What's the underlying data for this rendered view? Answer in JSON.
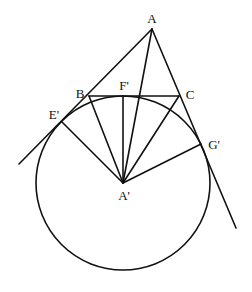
{
  "diagram": {
    "type": "geometry",
    "stroke_color": "#111111",
    "background": "#ffffff",
    "points": {
      "A": {
        "label": "A",
        "x": 152,
        "y": 29,
        "lx": 152,
        "ly": 23
      },
      "B": {
        "label": "B",
        "x": 89,
        "y": 96,
        "lx": 80,
        "ly": 98
      },
      "C": {
        "label": "C",
        "x": 179,
        "y": 96,
        "lx": 190,
        "ly": 99
      },
      "F1": {
        "label": "F'",
        "x": 123,
        "y": 96,
        "lx": 123,
        "ly": 90
      },
      "E1": {
        "label": "E'",
        "x": 62,
        "y": 122,
        "lx": 53,
        "ly": 119
      },
      "G1": {
        "label": "G'",
        "x": 201,
        "y": 144,
        "lx": 213,
        "ly": 149
      },
      "A1": {
        "label": "A'",
        "x": 123,
        "y": 183,
        "lx": 124,
        "ly": 200
      }
    },
    "circle": {
      "center": "A'",
      "cx": 123,
      "cy": 183,
      "r": 87
    },
    "labels": [
      "A",
      "B",
      "C",
      "F'",
      "E'",
      "G'",
      "A'"
    ]
  }
}
